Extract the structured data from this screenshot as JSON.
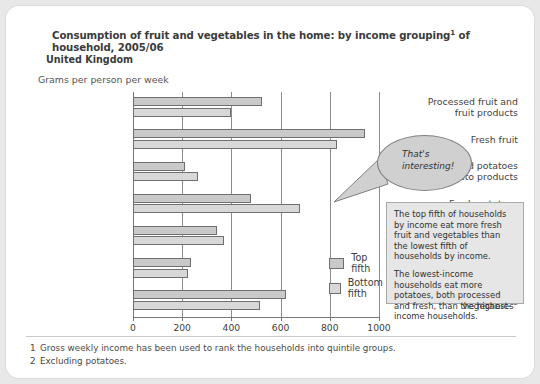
{
  "header": {
    "title_before": "Consumption of fruit and vegetables in the home: by income grouping",
    "title_sup": "1",
    "title_after": " of household, 2005/06",
    "region": "United Kingdom",
    "units": "Grams per person per week"
  },
  "callout": {
    "bubble_text": "That's interesting!",
    "note_paragraph_1": "The top fifth of households by income eat more fresh fruit and vegetables than the lowest fifth of households by income.",
    "note_paragraph_2": "The lowest-income households eat more potatoes, both processed and fresh, than the highest-income households."
  },
  "footnotes": [
    {
      "num": "1",
      "text": "Gross weekly income has been used to rank the households into quintile groups."
    },
    {
      "num": "2",
      "text": "Excluding potatoes."
    }
  ],
  "colors": {
    "top_fifth": "#c9c9c9",
    "bottom_fifth": "#d8d8d8",
    "bar_border": "#6f6f6f",
    "gridline": "#8b8b8b",
    "card_background": "#ffffff",
    "page_background": "#e8e8e8",
    "note_background": "#e6e6e6",
    "bubble_fill": "#d0d0d0"
  },
  "chart_data": {
    "type": "bar",
    "orientation": "horizontal",
    "subtitle": "United Kingdom",
    "xlabel": "Grams per person per week",
    "ylabel": "",
    "xlim": [
      0,
      1000
    ],
    "xticks": [
      0,
      200,
      400,
      600,
      800,
      1000
    ],
    "xticklabels": [
      "0",
      "200",
      "400",
      "600",
      "800",
      "1000"
    ],
    "grid": true,
    "legend_position": "inside-lower-right",
    "categories": [
      "Processed fruit and fruit products",
      "Fresh fruit",
      "Processed potatoes and potato products",
      "Fresh potatoes",
      "Processed vegetables",
      "Fresh green vegetables",
      "Other fresh vegetables"
    ],
    "category_lines": [
      [
        "Processed fruit and",
        "fruit products"
      ],
      [
        "Fresh fruit"
      ],
      [
        "Processed potatoes",
        "and potato products"
      ],
      [
        "Fresh potatoes"
      ],
      [
        "Processed",
        "vegetables"
      ],
      [
        "Fresh green",
        "vegetables"
      ],
      [
        "Other fresh",
        "vegetables"
      ]
    ],
    "category_footnote_marks": [
      "",
      "",
      "",
      "",
      "2",
      "",
      "2"
    ],
    "series": [
      {
        "name": "Top fifth",
        "values": [
          525,
          945,
          210,
          480,
          340,
          235,
          620
        ]
      },
      {
        "name": "Bottom fifth",
        "values": [
          400,
          830,
          265,
          680,
          370,
          225,
          515
        ]
      }
    ]
  }
}
